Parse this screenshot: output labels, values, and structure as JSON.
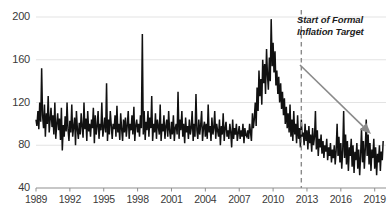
{
  "chart_data": {
    "type": "line",
    "title": "",
    "xlabel": "",
    "ylabel": "",
    "xlim": [
      1989,
      2020
    ],
    "ylim": [
      40,
      200
    ],
    "grid": true,
    "legend": false,
    "x_ticks": [
      "1989",
      "1992",
      "1995",
      "1998",
      "2001",
      "2004",
      "2007",
      "2010",
      "2013",
      "2016",
      "2019"
    ],
    "x_tick_values": [
      1989,
      1992,
      1995,
      1998,
      2001,
      2004,
      2007,
      2010,
      2013,
      2016,
      2019
    ],
    "y_ticks": [
      "40",
      "80",
      "120",
      "160",
      "200"
    ],
    "y_tick_values": [
      40,
      80,
      120,
      160,
      200
    ],
    "series_name": "index",
    "series_color": "#111111",
    "x": [
      1989.0,
      1989.08,
      1989.17,
      1989.25,
      1989.33,
      1989.42,
      1989.5,
      1989.58,
      1989.67,
      1989.75,
      1989.83,
      1989.92,
      1990.0,
      1990.08,
      1990.17,
      1990.25,
      1990.33,
      1990.42,
      1990.5,
      1990.58,
      1990.67,
      1990.75,
      1990.83,
      1990.92,
      1991.0,
      1991.08,
      1991.17,
      1991.25,
      1991.33,
      1991.42,
      1991.5,
      1991.58,
      1991.67,
      1991.75,
      1991.83,
      1991.92,
      1992.0,
      1992.08,
      1992.17,
      1992.25,
      1992.33,
      1992.42,
      1992.5,
      1992.58,
      1992.67,
      1992.75,
      1992.83,
      1992.92,
      1993.0,
      1993.08,
      1993.17,
      1993.25,
      1993.33,
      1993.42,
      1993.5,
      1993.58,
      1993.67,
      1993.75,
      1993.83,
      1993.92,
      1994.0,
      1994.08,
      1994.17,
      1994.25,
      1994.33,
      1994.42,
      1994.5,
      1994.58,
      1994.67,
      1994.75,
      1994.83,
      1994.92,
      1995.0,
      1995.08,
      1995.17,
      1995.25,
      1995.33,
      1995.42,
      1995.5,
      1995.58,
      1995.67,
      1995.75,
      1995.83,
      1995.92,
      1996.0,
      1996.08,
      1996.17,
      1996.25,
      1996.33,
      1996.42,
      1996.5,
      1996.58,
      1996.67,
      1996.75,
      1996.83,
      1996.92,
      1997.0,
      1997.08,
      1997.17,
      1997.25,
      1997.33,
      1997.42,
      1997.5,
      1997.58,
      1997.67,
      1997.75,
      1997.83,
      1997.92,
      1998.0,
      1998.08,
      1998.17,
      1998.25,
      1998.33,
      1998.42,
      1998.5,
      1998.58,
      1998.67,
      1998.75,
      1998.83,
      1998.92,
      1999.0,
      1999.08,
      1999.17,
      1999.25,
      1999.33,
      1999.42,
      1999.5,
      1999.58,
      1999.67,
      1999.75,
      1999.83,
      1999.92,
      2000.0,
      2000.08,
      2000.17,
      2000.25,
      2000.33,
      2000.42,
      2000.5,
      2000.58,
      2000.67,
      2000.75,
      2000.83,
      2000.92,
      2001.0,
      2001.08,
      2001.17,
      2001.25,
      2001.33,
      2001.42,
      2001.5,
      2001.58,
      2001.67,
      2001.75,
      2001.83,
      2001.92,
      2002.0,
      2002.08,
      2002.17,
      2002.25,
      2002.33,
      2002.42,
      2002.5,
      2002.58,
      2002.67,
      2002.75,
      2002.83,
      2002.92,
      2003.0,
      2003.08,
      2003.17,
      2003.25,
      2003.33,
      2003.42,
      2003.5,
      2003.58,
      2003.67,
      2003.75,
      2003.83,
      2003.92,
      2004.0,
      2004.08,
      2004.17,
      2004.25,
      2004.33,
      2004.42,
      2004.5,
      2004.58,
      2004.67,
      2004.75,
      2004.83,
      2004.92,
      2005.0,
      2005.08,
      2005.17,
      2005.25,
      2005.33,
      2005.42,
      2005.5,
      2005.58,
      2005.67,
      2005.75,
      2005.83,
      2005.92,
      2006.0,
      2006.08,
      2006.17,
      2006.25,
      2006.33,
      2006.42,
      2006.5,
      2006.58,
      2006.67,
      2006.75,
      2006.83,
      2006.92,
      2007.0,
      2007.08,
      2007.17,
      2007.25,
      2007.33,
      2007.42,
      2007.5,
      2007.58,
      2007.67,
      2007.75,
      2007.83,
      2007.92,
      2008.0,
      2008.08,
      2008.17,
      2008.25,
      2008.33,
      2008.42,
      2008.5,
      2008.58,
      2008.67,
      2008.75,
      2008.83,
      2008.92,
      2009.0,
      2009.08,
      2009.17,
      2009.25,
      2009.33,
      2009.42,
      2009.5,
      2009.58,
      2009.67,
      2009.75,
      2009.83,
      2009.92,
      2010.0,
      2010.08,
      2010.17,
      2010.25,
      2010.33,
      2010.42,
      2010.5,
      2010.58,
      2010.67,
      2010.75,
      2010.83,
      2010.92,
      2011.0,
      2011.08,
      2011.17,
      2011.25,
      2011.33,
      2011.42,
      2011.5,
      2011.58,
      2011.67,
      2011.75,
      2011.83,
      2011.92,
      2012.0,
      2012.08,
      2012.17,
      2012.25,
      2012.33,
      2012.42,
      2012.5,
      2012.58,
      2012.67,
      2012.75,
      2012.83,
      2012.92,
      2013.0,
      2013.08,
      2013.17,
      2013.25,
      2013.33,
      2013.42,
      2013.5,
      2013.58,
      2013.67,
      2013.75,
      2013.83,
      2013.92,
      2014.0,
      2014.08,
      2014.17,
      2014.25,
      2014.33,
      2014.42,
      2014.5,
      2014.58,
      2014.67,
      2014.75,
      2014.83,
      2014.92,
      2015.0,
      2015.08,
      2015.17,
      2015.25,
      2015.33,
      2015.42,
      2015.5,
      2015.58,
      2015.67,
      2015.75,
      2015.83,
      2015.92,
      2016.0,
      2016.08,
      2016.17,
      2016.25,
      2016.33,
      2016.42,
      2016.5,
      2016.58,
      2016.67,
      2016.75,
      2016.83,
      2016.92,
      2017.0,
      2017.08,
      2017.17,
      2017.25,
      2017.33,
      2017.42,
      2017.5,
      2017.58,
      2017.67,
      2017.75,
      2017.83,
      2017.92,
      2018.0,
      2018.08,
      2018.17,
      2018.25,
      2018.33,
      2018.42,
      2018.5,
      2018.58,
      2018.67,
      2018.75,
      2018.83,
      2018.92,
      2019.0,
      2019.08,
      2019.17,
      2019.25,
      2019.33,
      2019.42,
      2019.5,
      2019.58,
      2019.67,
      2019.75
    ],
    "y": [
      104,
      98,
      112,
      95,
      120,
      102,
      152,
      108,
      96,
      118,
      88,
      110,
      100,
      126,
      92,
      104,
      115,
      97,
      108,
      90,
      120,
      86,
      99,
      110,
      94,
      105,
      85,
      115,
      75,
      99,
      88,
      107,
      93,
      120,
      96,
      84,
      103,
      92,
      118,
      88,
      97,
      106,
      80,
      112,
      94,
      86,
      101,
      90,
      110,
      98,
      87,
      120,
      95,
      105,
      84,
      112,
      93,
      100,
      88,
      104,
      96,
      115,
      82,
      108,
      90,
      98,
      112,
      86,
      100,
      94,
      120,
      88,
      96,
      106,
      92,
      138,
      84,
      104,
      90,
      112,
      98,
      86,
      100,
      95,
      108,
      88,
      117,
      92,
      100,
      85,
      110,
      96,
      84,
      104,
      92,
      106,
      88,
      98,
      112,
      86,
      100,
      94,
      108,
      90,
      116,
      84,
      98,
      104,
      92,
      100,
      88,
      108,
      96,
      184,
      90,
      112,
      85,
      102,
      94,
      112,
      88,
      106,
      96,
      126,
      84,
      100,
      92,
      110,
      86,
      104,
      98,
      90,
      118,
      84,
      100,
      93,
      108,
      86,
      98,
      104,
      88,
      112,
      94,
      86,
      102,
      90,
      108,
      84,
      96,
      100,
      90,
      130,
      86,
      104,
      94,
      112,
      88,
      100,
      82,
      106,
      92,
      98,
      86,
      104,
      90,
      96,
      112,
      84,
      100,
      88,
      128,
      94,
      86,
      104,
      90,
      98,
      112,
      84,
      96,
      102,
      88,
      100,
      86,
      118,
      92,
      98,
      84,
      106,
      90,
      96,
      112,
      86,
      100,
      94,
      88,
      104,
      80,
      98,
      90,
      110,
      84,
      96,
      102,
      88,
      94,
      86,
      100,
      92,
      78,
      104,
      86,
      96,
      90,
      100,
      84,
      92,
      98,
      86,
      94,
      88,
      100,
      82,
      96,
      90,
      88,
      94,
      86,
      100,
      92,
      84,
      110,
      96,
      104,
      120,
      98,
      134,
      112,
      150,
      126,
      142,
      118,
      160,
      138,
      156,
      128,
      170,
      146,
      132,
      162,
      140,
      198,
      154,
      176,
      148,
      168,
      136,
      150,
      128,
      144,
      120,
      138,
      114,
      130,
      108,
      124,
      100,
      116,
      96,
      110,
      92,
      118,
      88,
      104,
      84,
      112,
      90,
      100,
      82,
      108,
      86,
      96,
      78,
      104,
      88,
      92,
      80,
      100,
      84,
      94,
      76,
      98,
      82,
      90,
      74,
      96,
      80,
      88,
      112,
      76,
      94,
      70,
      86,
      78,
      90,
      72,
      84,
      68,
      80,
      74,
      86,
      66,
      78,
      70,
      82,
      64,
      76,
      68,
      80,
      62,
      74,
      100,
      70,
      88,
      64,
      82,
      58,
      76,
      112,
      68,
      90,
      62,
      84,
      56,
      78,
      70,
      86,
      60,
      80,
      54,
      74,
      66,
      82,
      58,
      76,
      52,
      70,
      96,
      64,
      84,
      58,
      78,
      104,
      70,
      90,
      62,
      82,
      56,
      76,
      68,
      86,
      58,
      78,
      52,
      72,
      64,
      80,
      56,
      74,
      66,
      84,
      60,
      78,
      54,
      70,
      62,
      80,
      56,
      74,
      68,
      88,
      60,
      82,
      54,
      76,
      66,
      86,
      58,
      80,
      52,
      72,
      64,
      84,
      58,
      78,
      70,
      90,
      62,
      84,
      56,
      76,
      68,
      88,
      60,
      82,
      54,
      74,
      66,
      86,
      58,
      78,
      96,
      70,
      88,
      62,
      80,
      74,
      94,
      66,
      86,
      58,
      78,
      70,
      92,
      64,
      102,
      76,
      88,
      58
    ]
  },
  "annotation": {
    "line1": "Start of Formal",
    "line2": "Inflation Target",
    "marker_year": 2012.5,
    "marker_style": "dashed-vertical-line",
    "marker_color": "#8a8a8a"
  },
  "arrow": {
    "name": "trend-arrow",
    "color": "#8a8a8a",
    "direction": "down-right",
    "start": [
      300,
      65
    ],
    "end": [
      371,
      134
    ]
  },
  "colors": {
    "series": "#111111",
    "grid": "#e3e3e3",
    "axis": "#8f8f8f",
    "text": "#3a3a3a",
    "annotation_text": "#1c1c1c",
    "background": "#ffffff"
  }
}
